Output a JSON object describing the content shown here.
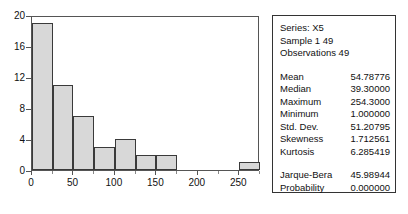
{
  "chart_data": {
    "type": "bar",
    "title": "",
    "xlabel": "",
    "ylabel": "",
    "grid": false,
    "legend": "none",
    "bin_width": 25,
    "xlim": [
      0,
      275
    ],
    "ylim": [
      0,
      20
    ],
    "x_ticks": [
      0,
      50,
      100,
      150,
      200,
      250
    ],
    "x_minor_ticks": [
      25,
      75,
      125,
      175,
      225,
      275
    ],
    "y_ticks": [
      0,
      4,
      8,
      12,
      16,
      20
    ],
    "categories": [
      "0-25",
      "25-50",
      "50-75",
      "75-100",
      "100-125",
      "125-150",
      "150-175",
      "175-200",
      "200-225",
      "225-250",
      "250-275"
    ],
    "bin_starts": [
      0,
      25,
      50,
      75,
      100,
      125,
      150,
      175,
      200,
      225,
      250
    ],
    "values": [
      19,
      11,
      7,
      3,
      4,
      2,
      2,
      0,
      0,
      0,
      1
    ],
    "bar_fill": "#d8d8d8",
    "bar_edge": "#3a3a3a",
    "axis_color": "#555555"
  },
  "stats_panel": {
    "header": [
      "Series: X5",
      "Sample 1 49",
      "Observations 49"
    ],
    "main_stats": [
      {
        "label": "Mean",
        "value": "54.78776"
      },
      {
        "label": "Median",
        "value": "39.30000"
      },
      {
        "label": "Maximum",
        "value": "254.3000"
      },
      {
        "label": "Minimum",
        "value": "1.000000"
      },
      {
        "label": "Std. Dev.",
        "value": "51.20795"
      },
      {
        "label": "Skewness",
        "value": "1.712561"
      },
      {
        "label": "Kurtosis",
        "value": "6.285419"
      }
    ],
    "test_stats": [
      {
        "label": "Jarque-Bera",
        "value": "45.98944"
      },
      {
        "label": "Probability",
        "value": "0.000000"
      }
    ]
  }
}
